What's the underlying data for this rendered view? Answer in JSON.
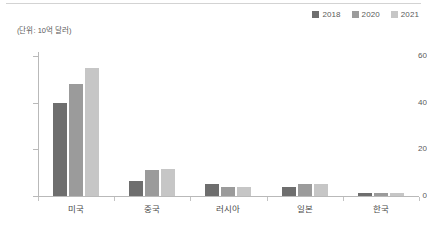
{
  "unit_caption": "(단위: 10억 달러)",
  "legend": {
    "position": "top-right",
    "items": [
      {
        "label": "2018",
        "color": "#6e6e6e",
        "icon": "square-swatch-icon"
      },
      {
        "label": "2020",
        "color": "#9b9b9b",
        "icon": "square-swatch-icon"
      },
      {
        "label": "2021",
        "color": "#c6c6c6",
        "icon": "square-swatch-icon"
      }
    ]
  },
  "axis": {
    "y_ticks": [
      "0",
      "20",
      "40",
      "60"
    ],
    "x_categories": [
      "미국",
      "중국",
      "러시아",
      "일본",
      "한국"
    ]
  },
  "chart_data": {
    "type": "bar",
    "title": "",
    "subtitle": "",
    "xlabel": "",
    "ylabel": "(단위: 10억 달러)",
    "ylim": [
      0,
      60
    ],
    "yticks": [
      0,
      20,
      40,
      60
    ],
    "grid": false,
    "legend_position": "top-right",
    "categories": [
      "미국",
      "중국",
      "러시아",
      "일본",
      "한국"
    ],
    "series": [
      {
        "name": "2018",
        "color": "#6e6e6e",
        "values": [
          40,
          6.5,
          5,
          4,
          1.2
        ]
      },
      {
        "name": "2020",
        "color": "#9b9b9b",
        "values": [
          48,
          11,
          4,
          5,
          1.2
        ]
      },
      {
        "name": "2021",
        "color": "#c6c6c6",
        "values": [
          55,
          11.5,
          4,
          5,
          1.2
        ]
      }
    ]
  }
}
